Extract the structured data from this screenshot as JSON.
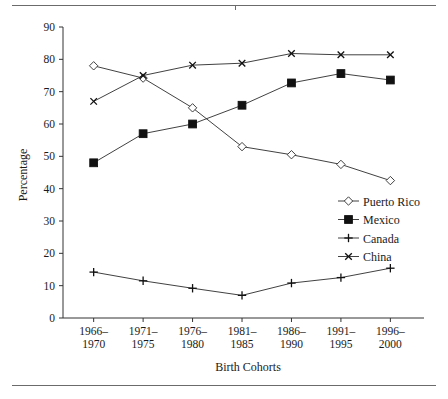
{
  "chart_data": {
    "type": "line",
    "title": "",
    "xlabel": "Birth Cohorts",
    "ylabel": "Percentage",
    "categories": [
      "1966–\n1970",
      "1971–\n1975",
      "1976–\n1980",
      "1981–\n1985",
      "1986–\n1990",
      "1991–\n1995",
      "1996–\n2000"
    ],
    "category_lines": [
      [
        "1966–",
        "1970"
      ],
      [
        "1971–",
        "1975"
      ],
      [
        "1976–",
        "1980"
      ],
      [
        "1981–",
        "1985"
      ],
      [
        "1986–",
        "1990"
      ],
      [
        "1991–",
        "1995"
      ],
      [
        "1996–",
        "2000"
      ]
    ],
    "ylim": [
      0,
      90
    ],
    "yticks": [
      0,
      10,
      20,
      30,
      40,
      50,
      60,
      70,
      80,
      90
    ],
    "grid": false,
    "legend_position": "right-inside",
    "series": [
      {
        "name": "Puerto Rico",
        "marker": "open-diamond",
        "values": [
          78.0,
          74.2,
          65.0,
          53.0,
          50.5,
          47.5,
          42.5
        ]
      },
      {
        "name": "Mexico",
        "marker": "filled-square",
        "values": [
          48.0,
          57.0,
          60.0,
          65.8,
          72.7,
          75.6,
          73.6
        ]
      },
      {
        "name": "Canada",
        "marker": "plus",
        "values": [
          14.2,
          11.5,
          9.2,
          7.0,
          10.8,
          12.5,
          15.4
        ]
      },
      {
        "name": "China",
        "marker": "cross",
        "values": [
          67.0,
          75.0,
          78.2,
          78.8,
          81.8,
          81.4,
          81.4
        ]
      }
    ]
  },
  "colors": {
    "line": "#2b2b2b",
    "axis": "#333333",
    "rule": "#6b6b6b",
    "background": "#ffffff"
  }
}
